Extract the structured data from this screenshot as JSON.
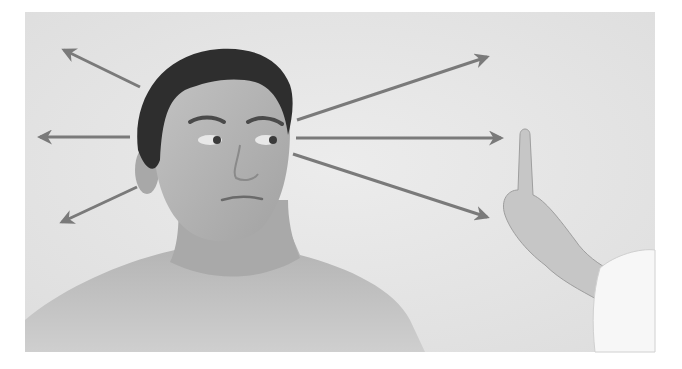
{
  "figure": {
    "colors": {
      "page_background": "#ffffff",
      "photo_background": "#e6e6e6",
      "arrow": "#7a7a7a",
      "hair": "#2e2e2e",
      "skin": "#b9b9b9",
      "skin_shadow": "#9a9a9a",
      "sleeve": "#f7f7f7"
    },
    "photo_frame": {
      "x": 25,
      "y": 12,
      "width": 630,
      "height": 340
    },
    "arrows": [
      {
        "name": "arrow-up-left",
        "x1": 140,
        "y1": 87,
        "x2": 64,
        "y2": 50
      },
      {
        "name": "arrow-left",
        "x1": 130,
        "y1": 137,
        "x2": 40,
        "y2": 137
      },
      {
        "name": "arrow-down-left",
        "x1": 137,
        "y1": 187,
        "x2": 62,
        "y2": 222
      },
      {
        "name": "arrow-up-right",
        "x1": 297,
        "y1": 120,
        "x2": 487,
        "y2": 57
      },
      {
        "name": "arrow-right",
        "x1": 296,
        "y1": 138,
        "x2": 501,
        "y2": 138
      },
      {
        "name": "arrow-down-right",
        "x1": 293,
        "y1": 154,
        "x2": 487,
        "y2": 217
      }
    ]
  }
}
